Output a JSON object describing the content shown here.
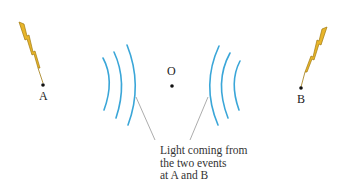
{
  "diagram": {
    "labels": {
      "event_a": "A",
      "event_b": "B",
      "observer": "O"
    },
    "caption": {
      "line1": "Light coming from",
      "line2": "the two events",
      "line3": "at A and B"
    },
    "icons": {
      "bolt_left": "lightning-bolt-icon",
      "bolt_right": "lightning-bolt-icon"
    },
    "colors": {
      "wavefront": "#3aa6d8",
      "bolt_fill": "#e8b52a",
      "bolt_outline": "#a07a10",
      "leader_line": "#888888",
      "text": "#222222"
    }
  }
}
